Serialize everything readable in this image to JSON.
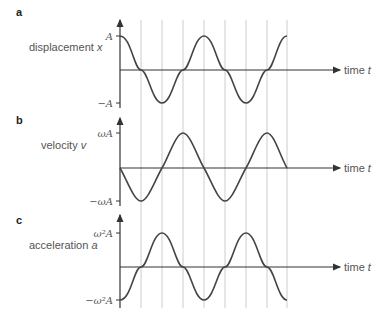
{
  "panels": [
    {
      "letter": "a",
      "quantity": "displacement",
      "symbol": "x",
      "max_label": "A",
      "min_label": "−A",
      "time_label": "time",
      "time_symbol": "t",
      "curve": "cos",
      "phase": "starts at +max"
    },
    {
      "letter": "b",
      "quantity": "velocity",
      "symbol": "v",
      "max_label": "ωA",
      "min_label": "−ωA",
      "time_label": "time",
      "time_symbol": "t",
      "curve": "-sin",
      "phase": "starts at zero going negative"
    },
    {
      "letter": "c",
      "quantity": "acceleration",
      "symbol": "a",
      "max_label": "ω²A",
      "min_label": "−ω²A",
      "time_label": "time",
      "time_symbol": "t",
      "curve": "-cos",
      "phase": "starts at -max"
    }
  ],
  "colors": {
    "curve": "#444444",
    "axis": "#333333",
    "grid": "#cccccc"
  }
}
